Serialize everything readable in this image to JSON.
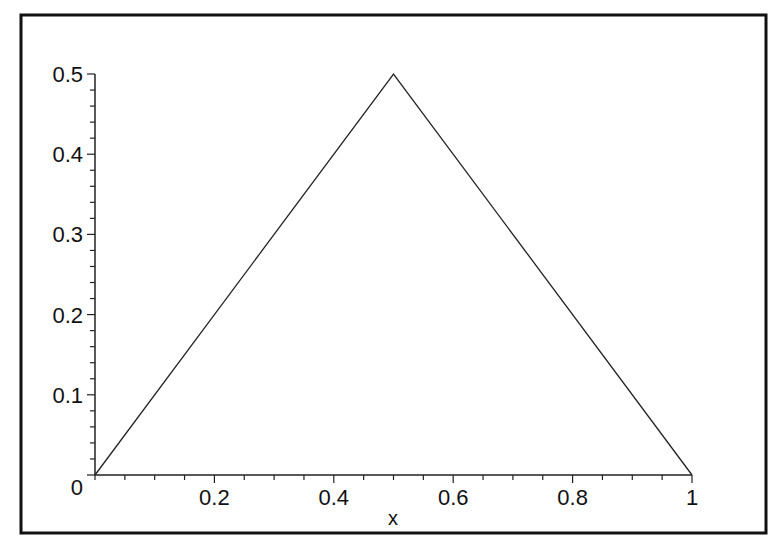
{
  "chart_data": {
    "type": "line",
    "title": "",
    "xlabel": "x",
    "ylabel": "",
    "xlim": [
      0,
      1
    ],
    "ylim": [
      0,
      0.5
    ],
    "x_ticks": [
      0.2,
      0.4,
      0.6,
      0.8,
      1
    ],
    "x_tick_labels": [
      "0.2",
      "0.4",
      "0.6",
      "0.8",
      "1"
    ],
    "y_ticks": [
      0,
      0.1,
      0.2,
      0.3,
      0.4,
      0.5
    ],
    "y_tick_labels": [
      "0",
      "0.1",
      "0.2",
      "0.3",
      "0.4",
      "0.5"
    ],
    "x_minor_step": 0.05,
    "y_minor_step": 0.02,
    "grid": false,
    "legend": null,
    "series": [
      {
        "name": "triangle",
        "x": [
          0,
          0.5,
          1
        ],
        "y": [
          0,
          0.5,
          0
        ],
        "color": "#222222"
      }
    ]
  },
  "frame": {
    "border_color": "#111111"
  }
}
